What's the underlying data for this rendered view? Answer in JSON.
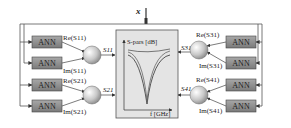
{
  "input_label": "x",
  "ann_label": "ANN",
  "center_box": {
    "y_axis_label": "S-pars [dB]",
    "x_axis_label": "f [GHz]"
  },
  "left_blocks": [
    {
      "re_label": "Re(S11)",
      "im_label": "Im(S11)",
      "output": "S11"
    },
    {
      "re_label": "Re(S21)",
      "im_label": "Im(S21)",
      "output": "S21"
    }
  ],
  "right_blocks": [
    {
      "re_label": "Re(S31)",
      "im_label": "Im(S31)",
      "output": "S31"
    },
    {
      "re_label": "Re(S41)",
      "im_label": "Im(S41)",
      "output": "S41"
    }
  ],
  "colors": {
    "ann_fill": "#8c8c8c",
    "box_fill": "#e4e4e4",
    "line": "#444444"
  }
}
